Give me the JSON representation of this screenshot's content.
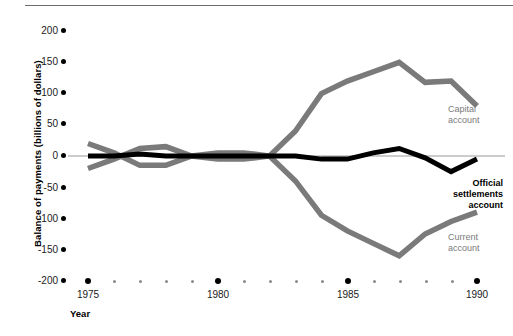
{
  "chart_data": {
    "type": "line",
    "title": "",
    "xlabel": "Year",
    "ylabel": "Balance of payments (billions of dollars)",
    "xlim": [
      1975,
      1990
    ],
    "ylim": [
      -200,
      200
    ],
    "xticks_major": [
      1975,
      1980,
      1985,
      1990
    ],
    "xtick_labels": [
      "1975",
      "1980",
      "1985",
      "1990"
    ],
    "yticks": [
      200,
      150,
      100,
      50,
      0,
      -50,
      -100,
      -150,
      -200
    ],
    "ytick_labels": [
      "200",
      "150",
      "100",
      "50",
      "0",
      "-50",
      "-100",
      "-150",
      "-200"
    ],
    "grid": false,
    "legend_position": "inline-right",
    "x": [
      1975,
      1976,
      1977,
      1978,
      1979,
      1980,
      1981,
      1982,
      1983,
      1984,
      1985,
      1986,
      1987,
      1988,
      1989,
      1990
    ],
    "series": [
      {
        "name": "Current account",
        "color": "#7a7a7a",
        "values": [
          20,
          5,
          -15,
          -15,
          0,
          5,
          5,
          0,
          -40,
          -95,
          -120,
          -140,
          -160,
          -125,
          -105,
          -90
        ]
      },
      {
        "name": "Capital account",
        "color": "#7a7a7a",
        "values": [
          -20,
          -5,
          12,
          15,
          0,
          -5,
          -5,
          0,
          40,
          100,
          120,
          135,
          150,
          118,
          120,
          80
        ]
      },
      {
        "name": "Official settlements account",
        "color": "#000000",
        "values": [
          0,
          0,
          3,
          0,
          0,
          0,
          0,
          0,
          0,
          -5,
          -5,
          5,
          12,
          -3,
          -25,
          -5
        ]
      }
    ]
  },
  "axis": {
    "ylabel": "Balance of payments (billions of dollars)",
    "xlabel": "Year",
    "ytick_labels": [
      "200",
      "150",
      "100",
      "50",
      "0",
      "-50",
      "-100",
      "-150",
      "-200"
    ],
    "xtick_labels": [
      "1975",
      "1980",
      "1985",
      "1990"
    ]
  },
  "labels": {
    "capital_line1": "Capital",
    "capital_line2": "account",
    "official_line1": "Official",
    "official_line2": "settlements",
    "official_line3": "account",
    "current_line1": "Current",
    "current_line2": "account"
  },
  "colors": {
    "gray_series": "#7a7a7a",
    "black_series": "#000000",
    "zero_line": "#9a9a9a",
    "background": "#ffffff"
  }
}
